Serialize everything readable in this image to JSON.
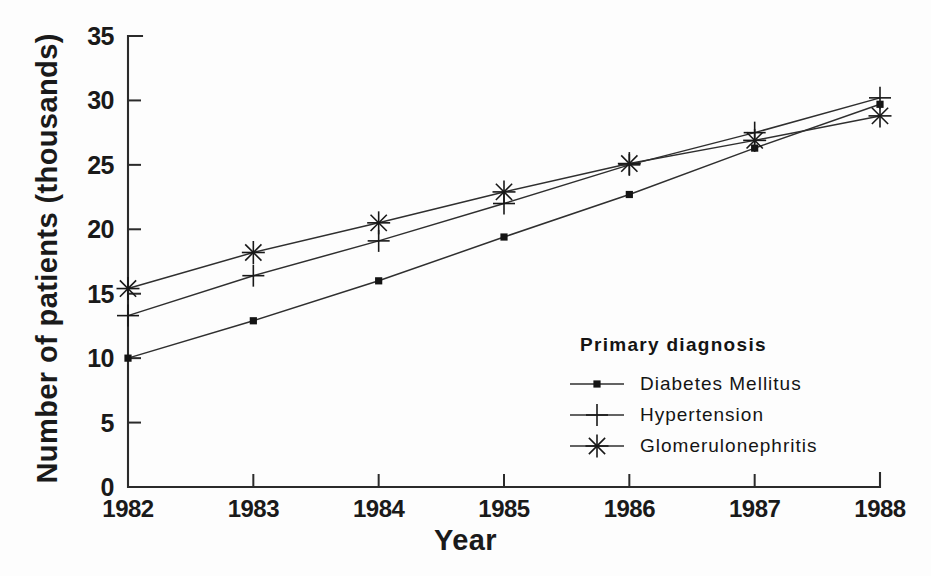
{
  "chart_data": {
    "type": "line",
    "title": "",
    "xlabel": "Year",
    "ylabel": "Number of patients (thousands)",
    "categories": [
      "1982",
      "1983",
      "1984",
      "1985",
      "1986",
      "1987",
      "1988"
    ],
    "x": [
      1982,
      1983,
      1984,
      1985,
      1986,
      1987,
      1988
    ],
    "xlim": [
      1982,
      1988
    ],
    "ylim": [
      0,
      35
    ],
    "yticks": [
      0,
      5,
      10,
      15,
      20,
      25,
      30,
      35
    ],
    "ytick_labels": [
      "0",
      "5",
      "10",
      "15",
      "20",
      "25",
      "30",
      "35"
    ],
    "grid": false,
    "legend_position": "inside-lower-right",
    "legend_title": "Primary diagnosis",
    "series": [
      {
        "name": "Diabetes Mellitus",
        "marker": "dot",
        "values": [
          10.0,
          12.9,
          16.0,
          19.4,
          22.7,
          26.3,
          29.7
        ]
      },
      {
        "name": "Hypertension",
        "marker": "plus",
        "values": [
          13.3,
          16.4,
          19.1,
          22.0,
          25.0,
          27.5,
          30.2
        ]
      },
      {
        "name": "Glomerulonephritis",
        "marker": "asterisk",
        "values": [
          15.4,
          18.2,
          20.5,
          22.9,
          25.1,
          26.9,
          28.8
        ]
      }
    ]
  },
  "colors": {
    "line": "#2f2f2f",
    "axis": "#2b2b2b",
    "text": "#1a1a1a",
    "background": "#ffffff"
  }
}
